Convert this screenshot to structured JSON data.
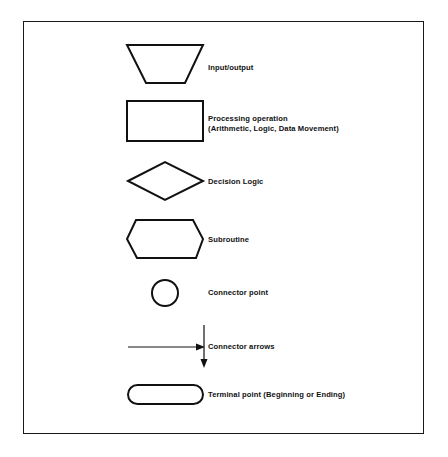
{
  "diagram": {
    "type": "flowchart-symbol-legend",
    "symbols": [
      {
        "shape": "trapezoid",
        "label": "Input/output"
      },
      {
        "shape": "rectangle",
        "label_line1": "Processing operation",
        "label_line2": "(Arithmetic, Logic, Data Movement)"
      },
      {
        "shape": "diamond",
        "label": "Decision Logic"
      },
      {
        "shape": "hexagon",
        "label": "Subroutine"
      },
      {
        "shape": "circle",
        "label": "Connector point"
      },
      {
        "shape": "arrows",
        "label": "Connector arrows"
      },
      {
        "shape": "rounded-rectangle",
        "label": "Terminal point (Beginning or Ending)"
      }
    ],
    "colors": {
      "stroke": "#111111",
      "background": "#ffffff"
    }
  }
}
